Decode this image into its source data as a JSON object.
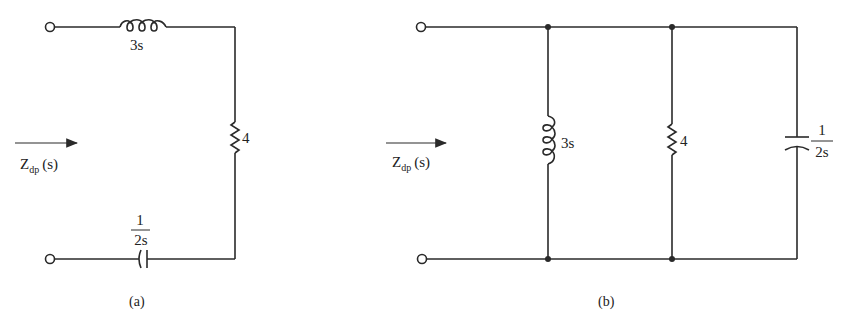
{
  "figure_a": {
    "caption": "(a)",
    "impedance_label": "Z",
    "impedance_sub": "dp",
    "impedance_arg": "(s)",
    "inductor_value": "3s",
    "resistor_value": "4",
    "capacitor_num": "1",
    "capacitor_den": "2s",
    "topology": "series"
  },
  "figure_b": {
    "caption": "(b)",
    "impedance_label": "Z",
    "impedance_sub": "dp",
    "impedance_arg": "(s)",
    "inductor_value": "3s",
    "resistor_value": "4",
    "capacitor_num": "1",
    "capacitor_den": "2s",
    "topology": "parallel"
  },
  "colors": {
    "ink": "#2a2a2a",
    "background": "#ffffff"
  }
}
